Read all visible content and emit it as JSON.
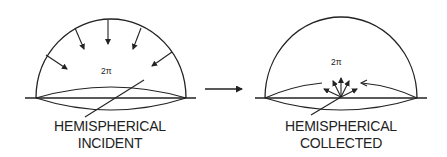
{
  "figure": {
    "panels": [
      {
        "id": "incident",
        "solid_angle_label": "2π",
        "caption_line1": "HEMISPHERICAL",
        "caption_line2": "INCIDENT",
        "rays_direction": "inward"
      },
      {
        "id": "collected",
        "solid_angle_label": "2π",
        "caption_line1": "HEMISPHERICAL",
        "caption_line2": "COLLECTED",
        "rays_direction": "outward"
      }
    ],
    "transition_arrow": "right-arrow",
    "ink_color": "#222222",
    "background_color": "#ffffff"
  }
}
